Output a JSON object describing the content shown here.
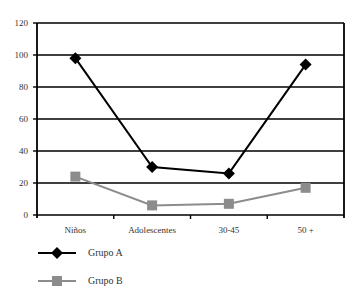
{
  "chart_data": {
    "type": "line",
    "title": "",
    "xlabel": "",
    "ylabel": "",
    "categories": [
      "Niños",
      "Adolescentes",
      "30-45",
      "50 +"
    ],
    "series": [
      {
        "name": "Grupo A",
        "values": [
          98,
          30,
          26,
          94
        ],
        "color": "#000000",
        "marker": "diamond"
      },
      {
        "name": "Grupo B",
        "values": [
          24,
          6,
          7,
          17
        ],
        "color": "#8c8c8c",
        "marker": "square"
      }
    ],
    "ylim": [
      0,
      120
    ],
    "yticks": [
      0,
      20,
      40,
      60,
      80,
      100,
      120
    ],
    "grid": true,
    "legend_position": "bottom-left"
  },
  "legend": {
    "items": [
      {
        "label": "Grupo A"
      },
      {
        "label": "Grupo B"
      }
    ]
  }
}
